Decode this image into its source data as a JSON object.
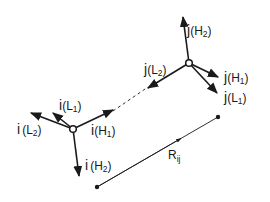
{
  "diagram": {
    "colors": {
      "ink": "#1a1a1a",
      "background": "#ffffff"
    },
    "frame_i": {
      "center": [
        73,
        129
      ],
      "axes": [
        {
          "id": "iL1",
          "base": "i",
          "paren_open": "(",
          "letter": "L",
          "sub": "1",
          "paren_close": ")"
        },
        {
          "id": "iL2",
          "base": "i",
          "paren_open": "(",
          "letter": "L",
          "sub": "2",
          "paren_close": ")"
        },
        {
          "id": "iH1",
          "base": "i",
          "paren_open": "(",
          "letter": "H",
          "sub": "1",
          "paren_close": ")"
        },
        {
          "id": "iH2",
          "base": "i",
          "paren_open": "(",
          "letter": "H",
          "sub": "2",
          "paren_close": ")"
        }
      ]
    },
    "frame_j": {
      "center": [
        189,
        63
      ],
      "axes": [
        {
          "id": "jH2",
          "base": "j",
          "paren_open": "(",
          "letter": "H",
          "sub": "2",
          "paren_close": ")"
        },
        {
          "id": "jL2",
          "base": "j",
          "paren_open": "(",
          "letter": "L",
          "sub": "2",
          "paren_close": ")"
        },
        {
          "id": "jH1",
          "base": "j",
          "paren_open": "(",
          "letter": "H",
          "sub": "1",
          "paren_close": ")"
        },
        {
          "id": "jL1",
          "base": "j",
          "paren_open": "(",
          "letter": "L",
          "sub": "1",
          "paren_close": ")"
        }
      ]
    },
    "separation_vector": {
      "label": "R",
      "sub": "ij",
      "start": [
        97,
        187
      ],
      "end": [
        218,
        117
      ]
    }
  }
}
